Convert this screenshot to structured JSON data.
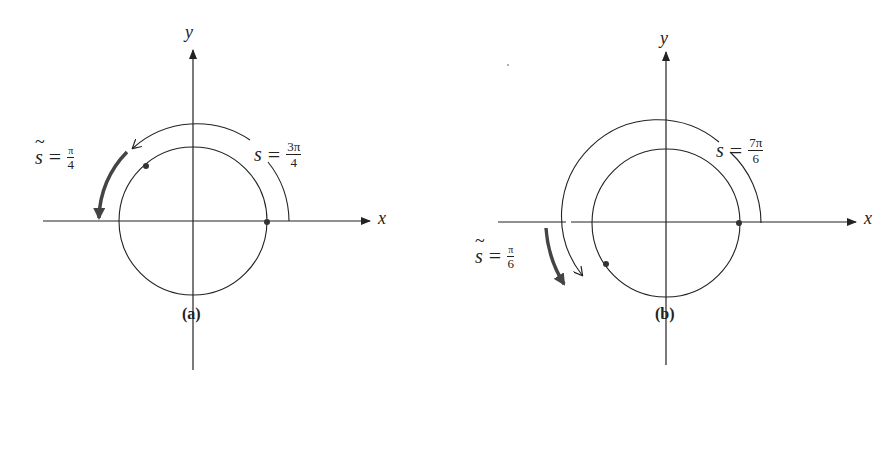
{
  "figure": {
    "panels": [
      {
        "id": "a",
        "caption": "(a)",
        "axes": {
          "x_label": "x",
          "y_label": "y"
        },
        "arc_label": {
          "var": "s",
          "op": "=",
          "num": "3π",
          "den": "4"
        },
        "ref_label": {
          "var": "s",
          "op": "=",
          "num": "π",
          "den": "4"
        },
        "s_value": "3π/4",
        "s_tilde_value": "π/4"
      },
      {
        "id": "b",
        "caption": "(b)",
        "axes": {
          "x_label": "x",
          "y_label": "y"
        },
        "arc_label": {
          "var": "s",
          "op": "=",
          "num": "7π",
          "den": "6"
        },
        "ref_label": {
          "var": "s",
          "op": "=",
          "num": "π",
          "den": "6"
        },
        "s_value": "7π/6",
        "s_tilde_value": "π/6"
      }
    ]
  },
  "colors": {
    "ink": "#222222",
    "arrow": "#444444",
    "background": "#ffffff"
  }
}
